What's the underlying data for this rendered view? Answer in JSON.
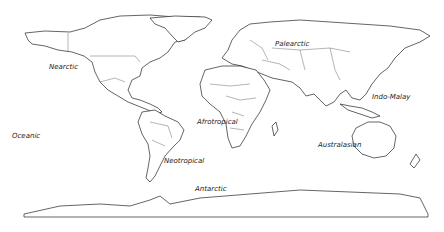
{
  "map": {
    "title": "Biogeographic realms world map",
    "realms": [
      {
        "id": "nearctic",
        "label": "Nearctic",
        "x": 49,
        "y": 63
      },
      {
        "id": "palearctic",
        "label": "Palearctic",
        "x": 275,
        "y": 40
      },
      {
        "id": "indo-malay",
        "label": "Indo-Malay",
        "x": 372,
        "y": 93
      },
      {
        "id": "oceanic",
        "label": "Oceanic",
        "x": 12,
        "y": 132
      },
      {
        "id": "afrotropical",
        "label": "Afrotropical",
        "x": 197,
        "y": 118
      },
      {
        "id": "neotropical",
        "label": "Neotropical",
        "x": 164,
        "y": 157
      },
      {
        "id": "australasian",
        "label": "Australasian",
        "x": 318,
        "y": 141
      },
      {
        "id": "antarctic",
        "label": "Antarctic",
        "x": 195,
        "y": 185
      }
    ],
    "colors": {
      "land_fill": "#ffffff",
      "outline": "#222222",
      "background": "#ffffff"
    }
  }
}
